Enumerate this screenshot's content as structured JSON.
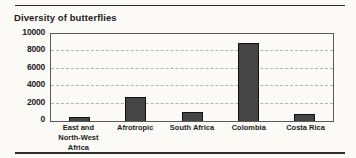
{
  "page": {
    "background": "#fbfaf6",
    "text_color": "#1c1c1c",
    "rule_color": "#2b2b2b"
  },
  "chart_data": {
    "type": "bar",
    "title": "Diversity of butterflies",
    "categories": [
      "East and\nNorth-West Africa",
      "Afrotropic",
      "South Africa",
      "Colombia",
      "Costa Rica"
    ],
    "values": [
      500,
      2800,
      1000,
      9000,
      750
    ],
    "xlabel": "",
    "ylabel": "",
    "ylim": [
      0,
      10000
    ],
    "yticks": [
      0,
      2000,
      4000,
      6000,
      8000,
      10000
    ],
    "grid": "horizontal-dashed",
    "legend": "none",
    "bar_color": "#454545",
    "bar_border_color": "#111111",
    "gridline_color": "#b3b3b3",
    "plot_border_color": "#5a5a5a"
  }
}
